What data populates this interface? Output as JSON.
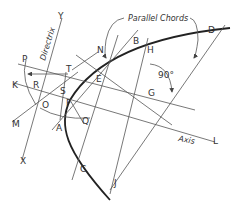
{
  "diagram": {
    "title_labels": {
      "parallel_chords": "Parallel Chords",
      "directrix": "Directrix",
      "axis": "Axis",
      "angle": "90°"
    },
    "points": {
      "P": "P",
      "K": "K",
      "R": "R",
      "M": "M",
      "O": "O",
      "X": "X",
      "Y": "Y",
      "T": "T",
      "S": "S",
      "F": "F",
      "A": "A",
      "Q": "Q",
      "N": "N",
      "E": "E",
      "B": "B",
      "H": "H",
      "G": "G",
      "D": "D",
      "C": "C",
      "J": "J",
      "L": "L"
    },
    "colors": {
      "curve": "#222222",
      "lines": "#555555",
      "text": "#333333"
    }
  }
}
